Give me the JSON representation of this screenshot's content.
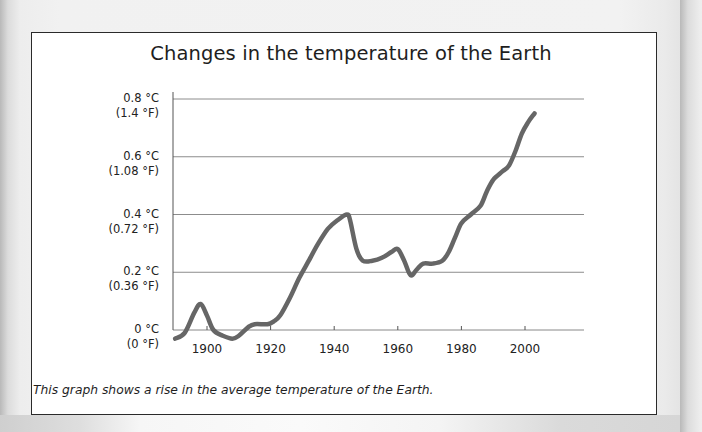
{
  "chart_data": {
    "type": "line",
    "title": "Changes in the temperature of the Earth",
    "xlabel": "",
    "ylabel": "",
    "caption": "This graph shows a rise in the average temperature of the Earth.",
    "x_ticks": [
      1900,
      1920,
      1940,
      1960,
      1980,
      2000
    ],
    "y_ticks": [
      {
        "value": 0.8,
        "celsius": "0.8 °C",
        "fahrenheit": "(1.4 °F)"
      },
      {
        "value": 0.6,
        "celsius": "0.6 °C",
        "fahrenheit": "(1.08 °F)"
      },
      {
        "value": 0.4,
        "celsius": "0.4 °C",
        "fahrenheit": "(0.72 °F)"
      },
      {
        "value": 0.2,
        "celsius": "0.2 °C",
        "fahrenheit": "(0.36 °F)"
      },
      {
        "value": 0.0,
        "celsius": "0 °C",
        "fahrenheit": "(0 °F)"
      }
    ],
    "xlim": [
      1890,
      2019
    ],
    "ylim": [
      0,
      0.8
    ],
    "grid": "horizontal",
    "legend": "none",
    "series": [
      {
        "name": "Temperature change (°C)",
        "color": "#666666",
        "x": [
          1890,
          1893,
          1896,
          1898,
          1900,
          1902,
          1905,
          1908,
          1910,
          1913,
          1915,
          1919,
          1921,
          1923,
          1926,
          1929,
          1932,
          1935,
          1938,
          1941,
          1944,
          1945,
          1947,
          1949,
          1952,
          1955,
          1958,
          1960,
          1962,
          1964,
          1966,
          1968,
          1971,
          1974,
          1976,
          1978,
          1980,
          1983,
          1986,
          1988,
          1990,
          1993,
          1995,
          1997,
          1999,
          2001,
          2003
        ],
        "values": [
          -0.03,
          -0.01,
          0.06,
          0.09,
          0.05,
          0.0,
          -0.02,
          -0.03,
          -0.02,
          0.01,
          0.02,
          0.02,
          0.03,
          0.05,
          0.11,
          0.18,
          0.24,
          0.3,
          0.35,
          0.38,
          0.4,
          0.38,
          0.28,
          0.24,
          0.24,
          0.25,
          0.27,
          0.28,
          0.24,
          0.19,
          0.21,
          0.23,
          0.23,
          0.24,
          0.27,
          0.32,
          0.37,
          0.4,
          0.43,
          0.48,
          0.52,
          0.55,
          0.57,
          0.62,
          0.68,
          0.72,
          0.75
        ]
      }
    ]
  }
}
